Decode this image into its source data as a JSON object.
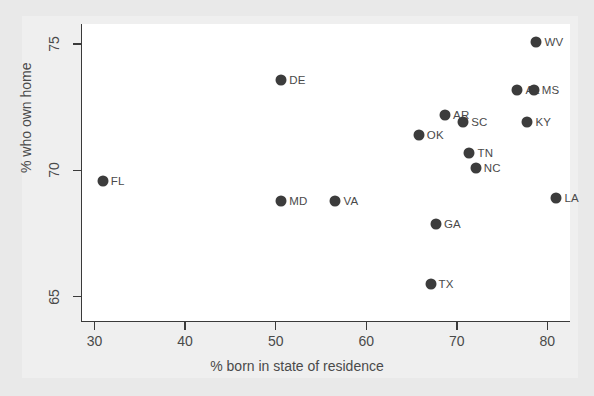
{
  "chart_data": {
    "type": "scatter",
    "title": "",
    "xlabel": "% born in state of residence",
    "ylabel": "% who own home",
    "xlim": [
      28.5,
      82.5
    ],
    "ylim": [
      64.0,
      75.8
    ],
    "xticks": [
      30,
      40,
      50,
      60,
      70,
      80
    ],
    "yticks": [
      65,
      70,
      75
    ],
    "grid": false,
    "legend": null,
    "marker_color": "#3c3c3c",
    "points": [
      {
        "label": "FL",
        "x": 30.9,
        "y": 69.6
      },
      {
        "label": "DE",
        "x": 50.6,
        "y": 73.6
      },
      {
        "label": "MD",
        "x": 50.6,
        "y": 68.8
      },
      {
        "label": "VA",
        "x": 56.6,
        "y": 68.8
      },
      {
        "label": "OK",
        "x": 65.8,
        "y": 71.4
      },
      {
        "label": "TX",
        "x": 67.1,
        "y": 65.5
      },
      {
        "label": "GA",
        "x": 67.7,
        "y": 67.9
      },
      {
        "label": "AR",
        "x": 68.7,
        "y": 72.2
      },
      {
        "label": "SC",
        "x": 70.7,
        "y": 71.9
      },
      {
        "label": "TN",
        "x": 71.4,
        "y": 70.7
      },
      {
        "label": "NC",
        "x": 72.1,
        "y": 70.1
      },
      {
        "label": "AL",
        "x": 76.7,
        "y": 73.2
      },
      {
        "label": "KY",
        "x": 77.8,
        "y": 71.9
      },
      {
        "label": "MS",
        "x": 78.5,
        "y": 73.2
      },
      {
        "label": "WV",
        "x": 78.8,
        "y": 75.1
      },
      {
        "label": "LA",
        "x": 81.0,
        "y": 68.9
      }
    ]
  }
}
